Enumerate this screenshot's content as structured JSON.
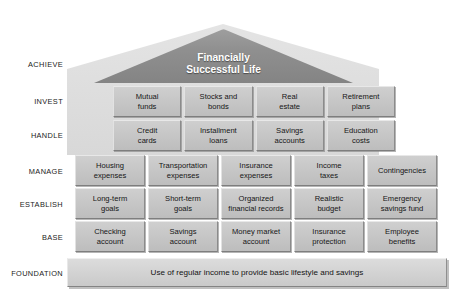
{
  "diagram": {
    "title_lines": [
      "Financially",
      "Successful Life"
    ],
    "tiers": [
      {
        "label": "ACHIEVE",
        "top": 60
      },
      {
        "label": "INVEST",
        "top": 97
      },
      {
        "label": "HANDLE",
        "top": 131
      },
      {
        "label": "MANAGE",
        "top": 167
      },
      {
        "label": "ESTABLISH",
        "top": 200
      },
      {
        "label": "BASE",
        "top": 233
      },
      {
        "label": "FOUNDATION",
        "top": 269
      }
    ],
    "rows": {
      "invest": [
        {
          "lines": [
            "Mutual",
            "funds"
          ]
        },
        {
          "lines": [
            "Stocks and",
            "bonds"
          ]
        },
        {
          "lines": [
            "Real",
            "estate"
          ]
        },
        {
          "lines": [
            "Retirement",
            "plans"
          ]
        }
      ],
      "handle": [
        {
          "lines": [
            "Credit",
            "cards"
          ]
        },
        {
          "lines": [
            "Installment",
            "loans"
          ]
        },
        {
          "lines": [
            "Savings",
            "accounts"
          ]
        },
        {
          "lines": [
            "Education",
            "costs"
          ]
        }
      ],
      "manage": [
        {
          "lines": [
            "Housing",
            "expenses"
          ]
        },
        {
          "lines": [
            "Transportation",
            "expenses"
          ]
        },
        {
          "lines": [
            "Insurance",
            "expenses"
          ]
        },
        {
          "lines": [
            "Income",
            "taxes"
          ]
        },
        {
          "lines": [
            "Contingencies"
          ]
        }
      ],
      "establish": [
        {
          "lines": [
            "Long-term",
            "goals"
          ]
        },
        {
          "lines": [
            "Short-term",
            "goals"
          ]
        },
        {
          "lines": [
            "Organized",
            "financial records"
          ]
        },
        {
          "lines": [
            "Realistic",
            "budget"
          ]
        },
        {
          "lines": [
            "Emergency",
            "savings fund"
          ]
        }
      ],
      "base": [
        {
          "lines": [
            "Checking",
            "account"
          ]
        },
        {
          "lines": [
            "Savings",
            "account"
          ]
        },
        {
          "lines": [
            "Money market",
            "account"
          ]
        },
        {
          "lines": [
            "Insurance",
            "protection"
          ]
        },
        {
          "lines": [
            "Employee",
            "benefits"
          ]
        }
      ]
    },
    "foundation_text": "Use of regular income to provide basic lifestyle and savings",
    "colors": {
      "roof_dark": "#8f8f8f",
      "house_light": "#dcdcdc",
      "brick_face": "#c6c6c6",
      "brick_highlight": "#e8e8e8",
      "brick_shadow": "#7e7e7e",
      "foundation_face": "#d2d2d2",
      "text": "#161616",
      "roof_text": "#ffffff",
      "background": "#ffffff"
    }
  }
}
